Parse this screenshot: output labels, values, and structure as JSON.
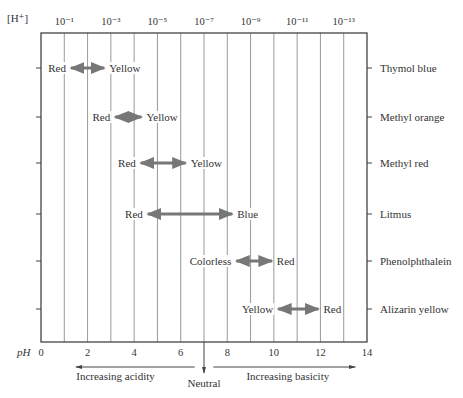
{
  "chart_data": {
    "type": "range-diagram",
    "title": "",
    "top_axis": {
      "label": "[H⁺]",
      "ticks": [
        {
          "pH": 1,
          "label": "10⁻¹"
        },
        {
          "pH": 3,
          "label": "10⁻³"
        },
        {
          "pH": 5,
          "label": "10⁻⁵"
        },
        {
          "pH": 7,
          "label": "10⁻⁷"
        },
        {
          "pH": 9,
          "label": "10⁻⁹"
        },
        {
          "pH": 11,
          "label": "10⁻¹¹"
        },
        {
          "pH": 13,
          "label": "10⁻¹³"
        }
      ]
    },
    "bottom_axis": {
      "label": "pH",
      "range": [
        0,
        14
      ],
      "ticks": [
        0,
        2,
        4,
        6,
        8,
        10,
        12,
        14
      ],
      "grid": "vertical line every 1 pH unit"
    },
    "indicators": [
      {
        "name": "Thymol blue",
        "acid_color": "Red",
        "base_color": "Yellow",
        "pH_low": 1.2,
        "pH_high": 2.8
      },
      {
        "name": "Methyl orange",
        "acid_color": "Red",
        "base_color": "Yellow",
        "pH_low": 3.1,
        "pH_high": 4.4
      },
      {
        "name": "Methyl red",
        "acid_color": "Red",
        "base_color": "Yellow",
        "pH_low": 4.2,
        "pH_high": 6.3
      },
      {
        "name": "Litmus",
        "acid_color": "Red",
        "base_color": "Blue",
        "pH_low": 4.5,
        "pH_high": 8.3
      },
      {
        "name": "Phenolphthalein",
        "acid_color": "Colorless",
        "base_color": "Red",
        "pH_low": 8.3,
        "pH_high": 10.0
      },
      {
        "name": "Alizarin yellow",
        "acid_color": "Yellow",
        "base_color": "Red",
        "pH_low": 10.1,
        "pH_high": 12.0
      }
    ],
    "annotations": {
      "left_arrow": "Increasing acidity",
      "center_arrow": "Neutral",
      "right_arrow": "Increasing basicity"
    }
  }
}
